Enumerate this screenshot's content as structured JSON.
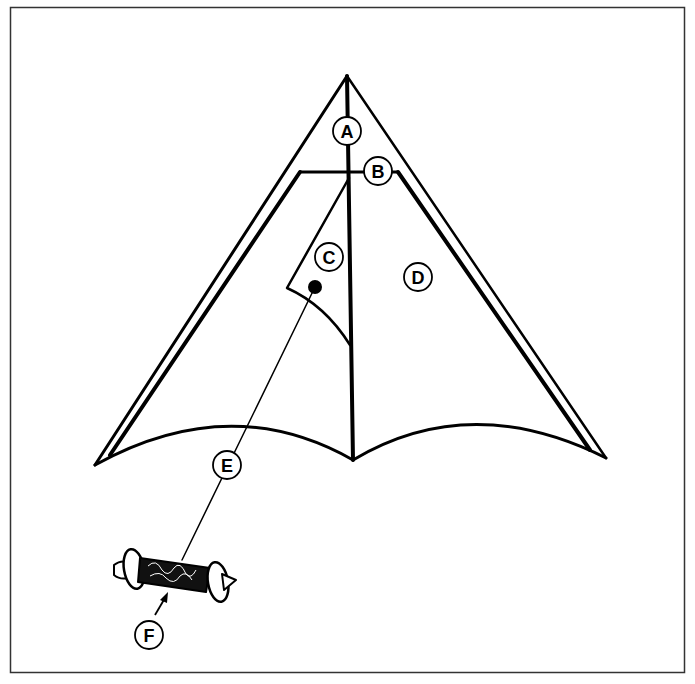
{
  "diagram": {
    "labels": {
      "A": "A",
      "B": "B",
      "C": "C",
      "D": "D",
      "E": "E",
      "F": "F"
    },
    "colors": {
      "stroke": "#000000",
      "background": "#ffffff",
      "border": "#333333"
    }
  }
}
